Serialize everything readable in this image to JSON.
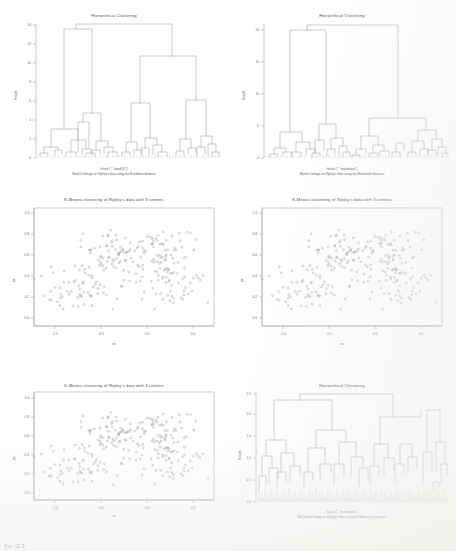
{
  "page": {
    "figure_caption": "Fig. 11.5"
  },
  "panels": [
    {
      "id": "dendro-euclidean",
      "title": "Hierarchical Clustering",
      "caption_line1": "hclust (*, \"ward.D2\")",
      "caption_line2": "Ward's Linkage on Ripley's data using the Euclidean distance",
      "ylabel": "Height",
      "xlabel": "",
      "yticks": [
        "0",
        "2",
        "4",
        "6",
        "8",
        "10",
        "12",
        "14"
      ]
    },
    {
      "id": "dendro-manhattan",
      "title": "Hierarchical Clustering",
      "caption_line1": "hclust (*, \"manhattan\")",
      "caption_line2": "Ward's Linkage on Ripley's data using the Manhattan distance",
      "ylabel": "Height",
      "xlabel": "",
      "yticks": [
        "0",
        "5",
        "10",
        "15",
        "20"
      ]
    },
    {
      "id": "kmeans-3-euclidean",
      "title": "K-Means clustering of Ripley's data with 3 centers",
      "caption_line1": "",
      "caption_line2": "",
      "ylabel": "ys",
      "xlabel": "xs",
      "xticks": [
        "-1.0",
        "-0.5",
        "0.0",
        "0.5"
      ],
      "yticks": [
        "0.0",
        "0.2",
        "0.4",
        "0.6",
        "0.8",
        "1.0"
      ]
    },
    {
      "id": "kmeans-3-manhattan",
      "title": "K-Means clustering of Ripley's data with 3 centers",
      "caption_line1": "",
      "caption_line2": "",
      "ylabel": "ys",
      "xlabel": "xs",
      "xticks": [
        "-1.0",
        "-0.5",
        "0.0",
        "0.5"
      ],
      "yticks": [
        "0.0",
        "0.2",
        "0.4",
        "0.6",
        "0.8",
        "1.0"
      ]
    },
    {
      "id": "kmeans-4",
      "title": "K-Means clustering of Ripley's data with 4 centers",
      "caption_line1": "",
      "caption_line2": "",
      "ylabel": "ys",
      "xlabel": "xs",
      "xticks": [
        "-1.0",
        "-0.5",
        "0.0",
        "0.5"
      ],
      "yticks": [
        "0.0",
        "0.2",
        "0.4",
        "0.6",
        "0.8",
        "1.0"
      ]
    },
    {
      "id": "dendro-mcquitty",
      "title": "Hierarchical Clustering",
      "caption_line1": "hclust (*, \"manhattan\")",
      "caption_line2": "McQuitty Linkage on Ripley's data using the Manhattan distance",
      "ylabel": "Height",
      "xlabel": "",
      "yticks": [
        "0.0",
        "0.5",
        "1.0",
        "1.5",
        "2.0",
        "2.5"
      ]
    }
  ],
  "chart_data": [
    {
      "type": "line",
      "id": "dendro-euclidean",
      "title": "Hierarchical Clustering",
      "xlabel": "hclust (*, \"ward.D2\")",
      "ylabel": "Height",
      "ylim": [
        0,
        15
      ],
      "grid": false,
      "legend": "none",
      "n_leaves": 250,
      "root_height": 14.2,
      "merge_heights": [
        14.2,
        6.1,
        4.2,
        2.6,
        2.2,
        1.9,
        1.5,
        1.3,
        1.1,
        0.9,
        0.7,
        0.5,
        0.35,
        0.2
      ]
    },
    {
      "type": "line",
      "id": "dendro-manhattan",
      "title": "Hierarchical Clustering",
      "xlabel": "hclust (*, \"manhattan\")",
      "ylabel": "Height",
      "ylim": [
        0,
        22
      ],
      "grid": false,
      "legend": "none",
      "n_leaves": 250,
      "root_height": 21.0,
      "merge_heights": [
        21.0,
        7.0,
        5.2,
        3.4,
        2.8,
        2.2,
        1.7,
        1.4,
        1.0,
        0.8,
        0.6,
        0.4,
        0.25
      ]
    },
    {
      "type": "scatter",
      "id": "kmeans-3-euclidean",
      "title": "K-Means clustering of Ripley's data with 3 centers",
      "xlabel": "xs",
      "ylabel": "ys",
      "xlim": [
        -1.3,
        1.0
      ],
      "ylim": [
        -0.1,
        1.15
      ],
      "grid": false,
      "legend": "none",
      "n_points": 250,
      "clusters": 3
    },
    {
      "type": "scatter",
      "id": "kmeans-3-manhattan",
      "title": "K-Means clustering of Ripley's data with 3 centers",
      "xlabel": "xs",
      "ylabel": "ys",
      "xlim": [
        -1.3,
        1.0
      ],
      "ylim": [
        -0.1,
        1.15
      ],
      "grid": false,
      "legend": "none",
      "n_points": 250,
      "clusters": 3
    },
    {
      "type": "scatter",
      "id": "kmeans-4",
      "title": "K-Means clustering of Ripley's data with 4 centers",
      "xlabel": "xs",
      "ylabel": "ys",
      "xlim": [
        -1.3,
        1.0
      ],
      "ylim": [
        -0.1,
        1.15
      ],
      "grid": false,
      "legend": "none",
      "n_points": 250,
      "clusters": 4
    },
    {
      "type": "line",
      "id": "dendro-mcquitty",
      "title": "Hierarchical Clustering",
      "xlabel": "hclust (*, \"manhattan\")",
      "ylabel": "Height",
      "ylim": [
        0,
        2.6
      ],
      "grid": false,
      "legend": "none",
      "n_leaves": 250,
      "root_height": 2.45,
      "merge_heights": [
        2.45,
        1.85,
        1.55,
        1.2,
        1.05,
        0.85,
        0.7,
        0.55,
        0.45,
        0.35,
        0.25,
        0.15,
        0.08
      ]
    }
  ]
}
